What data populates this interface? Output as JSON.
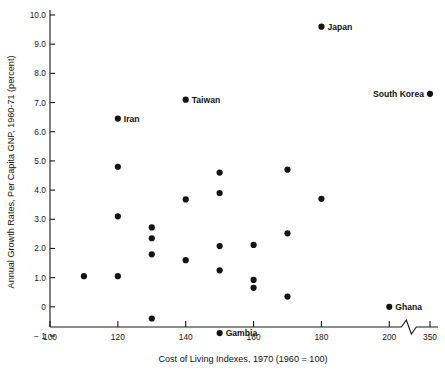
{
  "chart_data": {
    "type": "scatter",
    "title": "",
    "xlabel": "Cost of Living Indexes, 1970 (1960 = 100)",
    "ylabel": "Annual Growth Rates, Per Capita GNP, 1960-71 (percent)",
    "xlim": [
      100,
      215
    ],
    "ylim": [
      -1.6,
      10.4
    ],
    "grid": false,
    "legend": "none",
    "x_ticks": [
      {
        "value": 100,
        "label": "100"
      },
      {
        "value": 120,
        "label": "120"
      },
      {
        "value": 140,
        "label": "140"
      },
      {
        "value": 160,
        "label": "160"
      },
      {
        "value": 180,
        "label": "180"
      },
      {
        "value": 200,
        "label": "200"
      },
      {
        "value": 212,
        "label": "350"
      }
    ],
    "x_axis_break": {
      "at_value": 206.5,
      "note": "axis break between 200 and 350"
    },
    "y_ticks": [
      {
        "value": 10.0,
        "label": "10.0"
      },
      {
        "value": 9.0,
        "label": "9.0"
      },
      {
        "value": 8.0,
        "label": "8.0"
      },
      {
        "value": 7.0,
        "label": "7.0"
      },
      {
        "value": 6.0,
        "label": "6.0"
      },
      {
        "value": 5.0,
        "label": "5.0"
      },
      {
        "value": 4.0,
        "label": "4.0"
      },
      {
        "value": 3.0,
        "label": "3.0"
      },
      {
        "value": 2.0,
        "label": "2.0"
      },
      {
        "value": 1.0,
        "label": "1.0"
      },
      {
        "value": 0.0,
        "label": "0"
      },
      {
        "value": -1.0,
        "label": "− 1"
      }
    ],
    "points": [
      {
        "x": 180,
        "y": 9.6,
        "label": "Japan",
        "label_side": "right"
      },
      {
        "x": 212,
        "y": 7.3,
        "label": "South Korea",
        "label_side": "left"
      },
      {
        "x": 140,
        "y": 7.1,
        "label": "Taiwan",
        "label_side": "right"
      },
      {
        "x": 120,
        "y": 6.45,
        "label": "Iran",
        "label_side": "right"
      },
      {
        "x": 200,
        "y": 0.0,
        "label": "Ghana",
        "label_side": "right"
      },
      {
        "x": 150,
        "y": -0.9,
        "label": "Gambia",
        "label_side": "right"
      },
      {
        "x": 120,
        "y": 4.8,
        "label": "",
        "label_side": "right"
      },
      {
        "x": 120,
        "y": 3.1,
        "label": "",
        "label_side": "right"
      },
      {
        "x": 120,
        "y": 1.05,
        "label": "",
        "label_side": "right"
      },
      {
        "x": 110,
        "y": 1.05,
        "label": "",
        "label_side": "right"
      },
      {
        "x": 130,
        "y": 2.72,
        "label": "",
        "label_side": "right"
      },
      {
        "x": 130,
        "y": 2.35,
        "label": "",
        "label_side": "right"
      },
      {
        "x": 130,
        "y": 1.8,
        "label": "",
        "label_side": "right"
      },
      {
        "x": 130,
        "y": -0.4,
        "label": "",
        "label_side": "right"
      },
      {
        "x": 140,
        "y": 3.68,
        "label": "",
        "label_side": "right"
      },
      {
        "x": 140,
        "y": 1.6,
        "label": "",
        "label_side": "right"
      },
      {
        "x": 150,
        "y": 4.6,
        "label": "",
        "label_side": "right"
      },
      {
        "x": 150,
        "y": 3.9,
        "label": "",
        "label_side": "right"
      },
      {
        "x": 150,
        "y": 2.08,
        "label": "",
        "label_side": "right"
      },
      {
        "x": 150,
        "y": 1.25,
        "label": "",
        "label_side": "right"
      },
      {
        "x": 160,
        "y": 2.12,
        "label": "",
        "label_side": "right"
      },
      {
        "x": 160,
        "y": 0.92,
        "label": "",
        "label_side": "right"
      },
      {
        "x": 160,
        "y": 0.65,
        "label": "",
        "label_side": "right"
      },
      {
        "x": 170,
        "y": 4.7,
        "label": "",
        "label_side": "right"
      },
      {
        "x": 170,
        "y": 2.52,
        "label": "",
        "label_side": "right"
      },
      {
        "x": 170,
        "y": 0.35,
        "label": "",
        "label_side": "right"
      },
      {
        "x": 180,
        "y": 3.7,
        "label": "",
        "label_side": "right"
      }
    ],
    "marker": {
      "shape": "circle",
      "size_px": 3.1,
      "color": "#141414"
    }
  }
}
